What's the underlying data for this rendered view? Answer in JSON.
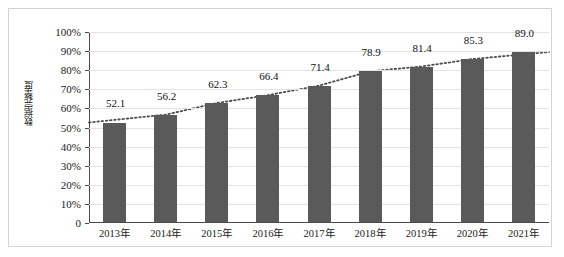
{
  "chart_data": {
    "type": "bar",
    "title": "",
    "subtitle": "",
    "xlabel": "",
    "ylabel": "数据完整度",
    "categories": [
      "2013年",
      "2014年",
      "2015年",
      "2016年",
      "2017年",
      "2018年",
      "2019年",
      "2020年",
      "2021年"
    ],
    "values": [
      52.1,
      56.2,
      62.3,
      66.4,
      71.4,
      78.9,
      81.4,
      85.3,
      89.0
    ],
    "data_labels": [
      "52.1",
      "56.2",
      "62.3",
      "66.4",
      "71.4",
      "78.9",
      "81.4",
      "85.3",
      "89.0"
    ],
    "ylim": [
      0,
      100
    ],
    "y_tick_labels": [
      "100%",
      "90%",
      "80%",
      "70%",
      "60%",
      "50%",
      "40%",
      "30%",
      "20%",
      "10%",
      "0"
    ],
    "y_tick_values": [
      100,
      90,
      80,
      70,
      60,
      50,
      40,
      30,
      20,
      10,
      0
    ],
    "grid": true,
    "legend": false,
    "legend_position": "none",
    "series": [
      {
        "name": "数据完整度",
        "type": "bar",
        "color": "#5a5a5a",
        "values": [
          52.1,
          56.2,
          62.3,
          66.4,
          71.4,
          78.9,
          81.4,
          85.3,
          89.0
        ]
      },
      {
        "name": "趋势线",
        "type": "line",
        "style": "dotted",
        "color": "#4d4d4d",
        "values": [
          52.1,
          56.2,
          62.3,
          66.4,
          71.4,
          78.9,
          81.4,
          85.3,
          89.0
        ]
      }
    ],
    "annotations": []
  },
  "colors": {
    "bar": "#5a5a5a",
    "gridline": "#e3e3e3",
    "axis": "#4a4a4a",
    "frame": "#d4d4d4",
    "text": "#1a1a1a",
    "trendline": "#4d4d4d"
  }
}
